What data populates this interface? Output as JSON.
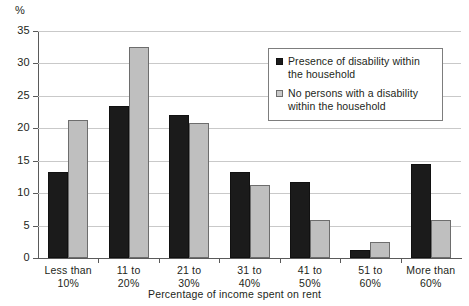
{
  "chart_data": {
    "type": "bar",
    "title": "",
    "xlabel": "Percentage of income spent on rent",
    "ylabel": "%",
    "ylim": [
      0,
      35
    ],
    "yticks": [
      0,
      5,
      10,
      15,
      20,
      25,
      30,
      35
    ],
    "grid": true,
    "legend_position": "top-right",
    "categories": [
      "Less than 10%",
      "11 to 20%",
      "21 to 30%",
      "31 to 40%",
      "41 to 50%",
      "51 to 60%",
      "More than 60%"
    ],
    "category_lines": [
      [
        "Less than",
        "10%"
      ],
      [
        "11 to",
        "20%"
      ],
      [
        "21 to",
        "30%"
      ],
      [
        "31 to",
        "40%"
      ],
      [
        "41 to",
        "50%"
      ],
      [
        "51 to",
        "60%"
      ],
      [
        "More than",
        "60%"
      ]
    ],
    "series": [
      {
        "name": "Presence of disability within the household",
        "color": "#1b1b1b",
        "values": [
          13.3,
          23.5,
          22.0,
          13.2,
          11.7,
          1.3,
          14.5
        ]
      },
      {
        "name": "No persons with a disability within the household",
        "color": "#bfbfbf",
        "values": [
          21.3,
          32.5,
          20.8,
          11.3,
          5.8,
          2.5,
          5.8
        ]
      }
    ]
  },
  "axis": {
    "y_unit_label": "%",
    "y_tick_labels": [
      "0",
      "5",
      "10",
      "15",
      "20",
      "25",
      "30",
      "35"
    ],
    "x_axis_title": "Percentage of income spent on rent"
  },
  "legend": {
    "items": [
      {
        "line1": "Presence of disability within",
        "line2": "the household",
        "swatch": "dark-square-swatch"
      },
      {
        "line1": "No persons with a disability",
        "line2": "within the household",
        "swatch": "light-square-swatch"
      }
    ]
  },
  "colors": {
    "series_dark": "#1b1b1b",
    "series_light": "#bfbfbf",
    "gridline": "#c9c9c9",
    "axis": "#5a5a5a",
    "text": "#231f20",
    "background": "#ffffff"
  }
}
